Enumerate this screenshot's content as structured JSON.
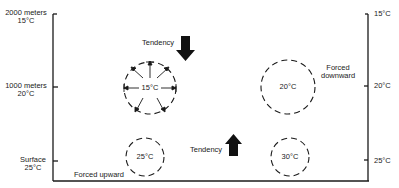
{
  "left_axis": {
    "ticks": [
      {
        "line1": "2000 meters",
        "line2": "15°C"
      },
      {
        "line1": "1000 meters",
        "line2": "20°C"
      },
      {
        "line1": "Surface",
        "line2": "25°C"
      }
    ]
  },
  "right_axis": {
    "ticks": [
      "15°C",
      "20°C",
      "25°C"
    ]
  },
  "parcels": [
    {
      "label": "15°C",
      "position": "1000 meters, left",
      "expansion_arrows": true
    },
    {
      "label": "20°C",
      "position": "1000 meters, right"
    },
    {
      "label": "25°C",
      "position": "surface, left"
    },
    {
      "label": "30°C",
      "position": "surface, right"
    }
  ],
  "annotations": {
    "tendency_down": "Tendency",
    "tendency_up": "Tendency",
    "forced_downward_line1": "Forced",
    "forced_downward_line2": "downward",
    "forced_upward": "Forced upward"
  },
  "colors": {
    "line": "#1a1a1a",
    "background": "#ffffff"
  }
}
